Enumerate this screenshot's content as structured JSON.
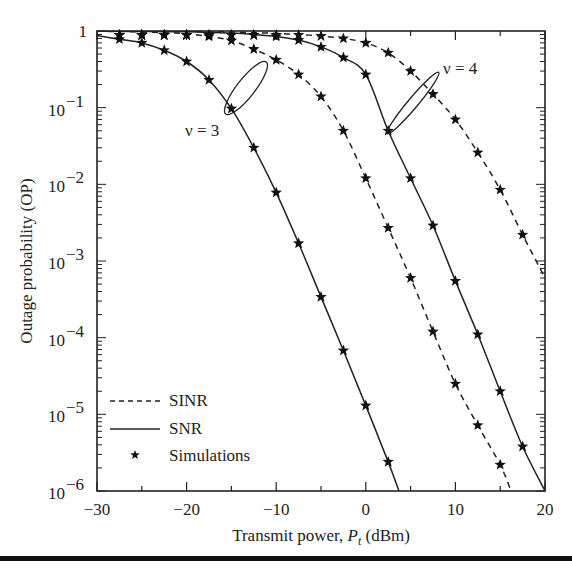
{
  "chart_data": {
    "type": "line",
    "title": "",
    "xlabel": "Transmit power, P_t (dBm)",
    "xlabel_parts": {
      "prefix": "Transmit power, ",
      "var": "P",
      "sub": "t",
      "suffix": " (dBm)"
    },
    "ylabel": "Outage probability (OP)",
    "xlim": [
      -30,
      20
    ],
    "ylim": [
      1e-06,
      1
    ],
    "yscale": "log",
    "grid": false,
    "x_ticks": [
      -30,
      -20,
      -10,
      0,
      10,
      20
    ],
    "x_tick_labels": [
      "−30",
      "−20",
      "−10",
      "0",
      "10",
      "20"
    ],
    "y_ticks": [
      1,
      0.1,
      0.01,
      0.001,
      0.0001,
      1e-05,
      1e-06
    ],
    "y_tick_labels": [
      {
        "base": "1",
        "exp": ""
      },
      {
        "base": "10",
        "exp": "−1"
      },
      {
        "base": "10",
        "exp": "−2"
      },
      {
        "base": "10",
        "exp": "−3"
      },
      {
        "base": "10",
        "exp": "−4"
      },
      {
        "base": "10",
        "exp": "−5"
      },
      {
        "base": "10",
        "exp": "−6"
      }
    ],
    "legend": {
      "position": "lower left",
      "entries": [
        {
          "label": "SINR",
          "style": "dashed"
        },
        {
          "label": "SNR",
          "style": "solid"
        },
        {
          "label": "Simulations",
          "style": "star-marker"
        }
      ]
    },
    "annotations": [
      {
        "text": "ν = 3",
        "x_db": -16.5,
        "y": 0.06
      },
      {
        "text": "ν = 4",
        "x_db": 10.5,
        "y": 0.22
      }
    ],
    "series": [
      {
        "name": "SNR, ν = 3",
        "style": "solid",
        "x": [
          -30,
          -27.5,
          -25,
          -22.5,
          -20,
          -17.5,
          -15,
          -12.5,
          -10,
          -7.5,
          -5,
          -2.5,
          0,
          2.5,
          3.7
        ],
        "y": [
          0.87,
          0.78,
          0.7,
          0.56,
          0.4,
          0.23,
          0.097,
          0.03,
          0.0078,
          0.0017,
          0.00034,
          6.8e-05,
          1.3e-05,
          2.4e-06,
          1e-06
        ],
        "markers_x": [
          -27.5,
          -25,
          -22.5,
          -20,
          -17.5,
          -15,
          -12.5,
          -10,
          -7.5,
          -5,
          -2.5,
          0,
          2.5
        ]
      },
      {
        "name": "SINR, ν = 3",
        "style": "dashed",
        "x": [
          -30,
          -27.5,
          -25,
          -22.5,
          -20,
          -17.5,
          -15,
          -12.5,
          -10,
          -7.5,
          -5,
          -2.5,
          0,
          2.5,
          5,
          7.5,
          10,
          12.5,
          15,
          16.2
        ],
        "y": [
          0.99,
          0.985,
          0.97,
          0.95,
          0.92,
          0.85,
          0.75,
          0.58,
          0.42,
          0.27,
          0.14,
          0.05,
          0.012,
          0.0027,
          0.0006,
          0.00012,
          2.5e-05,
          7.2e-06,
          2.2e-06,
          1e-06
        ],
        "markers_x": [
          -27.5,
          -25,
          -22.5,
          -20,
          -17.5,
          -15,
          -12.5,
          -10,
          -7.5,
          -5,
          -2.5,
          0,
          2.5,
          5,
          7.5,
          10,
          12.5,
          15
        ]
      },
      {
        "name": "SNR, ν = 4",
        "style": "solid",
        "x": [
          -30,
          -27.5,
          -25,
          -22.5,
          -20,
          -17.5,
          -15,
          -12.5,
          -10,
          -7.5,
          -5,
          -2.5,
          0,
          2.5,
          5,
          7.5,
          10,
          12.5,
          15,
          17.5,
          20
        ],
        "y": [
          0.99,
          0.99,
          0.985,
          0.98,
          0.975,
          0.96,
          0.94,
          0.9,
          0.85,
          0.76,
          0.62,
          0.45,
          0.27,
          0.05,
          0.012,
          0.0029,
          0.00055,
          0.00011,
          2e-05,
          3.8e-06,
          1e-06
        ],
        "markers_x": [
          -27.5,
          -25,
          -22.5,
          -20,
          -17.5,
          -15,
          -12.5,
          -10,
          -7.5,
          -5,
          -2.5,
          0,
          2.5,
          5,
          7.5,
          10,
          12.5,
          15,
          17.5
        ]
      },
      {
        "name": "SINR, ν = 4",
        "style": "dashed",
        "x": [
          -30,
          -27.5,
          -25,
          -22.5,
          -20,
          -17.5,
          -15,
          -12.5,
          -10,
          -7.5,
          -5,
          -2.5,
          0,
          2.5,
          5,
          7.5,
          10,
          12.5,
          15,
          17.5,
          20
        ],
        "y": [
          0.995,
          0.995,
          0.99,
          0.99,
          0.985,
          0.98,
          0.97,
          0.95,
          0.93,
          0.9,
          0.86,
          0.8,
          0.7,
          0.52,
          0.3,
          0.15,
          0.07,
          0.026,
          0.0085,
          0.0022,
          0.0006
        ],
        "markers_x": [
          -27.5,
          -25,
          -22.5,
          -20,
          -17.5,
          -15,
          -12.5,
          -10,
          -7.5,
          -5,
          -2.5,
          0,
          2.5,
          5,
          7.5,
          10,
          12.5,
          15,
          17.5
        ]
      }
    ]
  }
}
